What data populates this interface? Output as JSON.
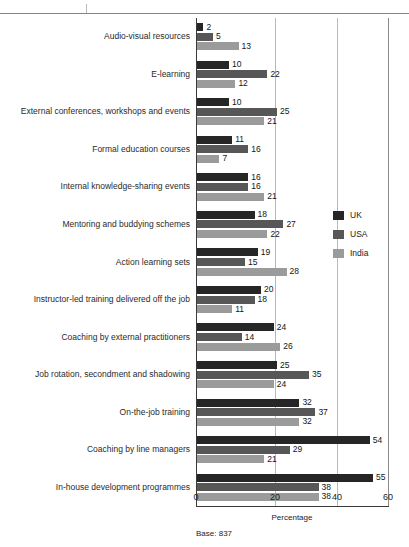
{
  "chart_data": {
    "type": "bar",
    "orientation": "horizontal",
    "title": "",
    "xlabel": "Percentage",
    "ylabel": "",
    "xlim": [
      0,
      60
    ],
    "xticks": [
      0,
      20,
      40,
      60
    ],
    "grid": true,
    "legend_position": "right",
    "categories": [
      "Audio-visual resources",
      "E-learning",
      "External conferences, workshops and events",
      "Formal education courses",
      "Internal knowledge-sharing events",
      "Mentoring and buddying schemes",
      "Action learning sets",
      "Instructor-led training delivered off the job",
      "Coaching by external practitioners",
      "Job rotation, secondment and shadowing",
      "On-the-job training",
      "Coaching by line managers",
      "In-house development programmes"
    ],
    "series": [
      {
        "name": "UK",
        "color": "#262626",
        "values": [
          2,
          10,
          10,
          11,
          16,
          18,
          19,
          20,
          24,
          25,
          32,
          54,
          55
        ]
      },
      {
        "name": "USA",
        "color": "#575757",
        "values": [
          5,
          22,
          25,
          16,
          16,
          27,
          15,
          18,
          14,
          35,
          37,
          29,
          38
        ]
      },
      {
        "name": "India",
        "color": "#9b9b9b",
        "values": [
          13,
          12,
          21,
          7,
          21,
          22,
          28,
          11,
          26,
          24,
          32,
          21,
          38
        ]
      }
    ],
    "annotation": "Base: 837"
  },
  "axis": {
    "tick_0": "0",
    "tick_20": "20",
    "tick_40": "40",
    "tick_60": "60",
    "xlabel": "Percentage"
  },
  "legend": {
    "items": [
      {
        "label": "UK"
      },
      {
        "label": "USA"
      },
      {
        "label": "India"
      }
    ]
  },
  "footer": {
    "base": "Base: 837"
  }
}
